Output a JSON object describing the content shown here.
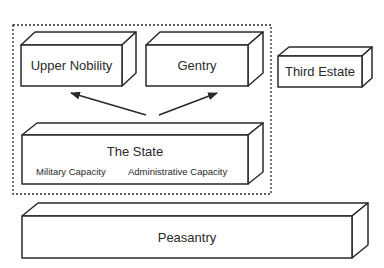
{
  "diagram": {
    "type": "block-diagram",
    "group_border": "dashed",
    "boxes": {
      "upper_nobility": {
        "label": "Upper Nobility"
      },
      "gentry": {
        "label": "Gentry"
      },
      "third_estate": {
        "label": "Third Estate"
      },
      "state": {
        "label": "The State",
        "capacities": [
          "Military Capacity",
          "Administrative Capacity"
        ]
      },
      "peasantry": {
        "label": "Peasantry"
      }
    },
    "edges": [
      {
        "from": "The State",
        "to": "Upper Nobility"
      },
      {
        "from": "The State",
        "to": "Gentry"
      }
    ],
    "colors": {
      "stroke": "#2a2a2a",
      "fill": "#ffffff",
      "text": "#2a2a2a"
    }
  }
}
